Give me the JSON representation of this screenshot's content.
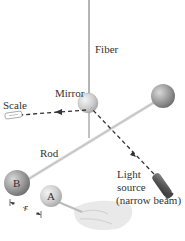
{
  "labels": {
    "fiber": "Fiber",
    "mirror": "Mirror",
    "scale": "Scale",
    "rod": "Rod",
    "light_line1": "Light",
    "light_line2": "source",
    "light_line3": "(narrow beam)",
    "sphere_b": "B",
    "sphere_a": "A",
    "distance": "r"
  },
  "colors": {
    "large_sphere": "#8f8f8f",
    "small_sphere": "#c9c9c9",
    "beam": "#333333",
    "text": "#333333"
  }
}
